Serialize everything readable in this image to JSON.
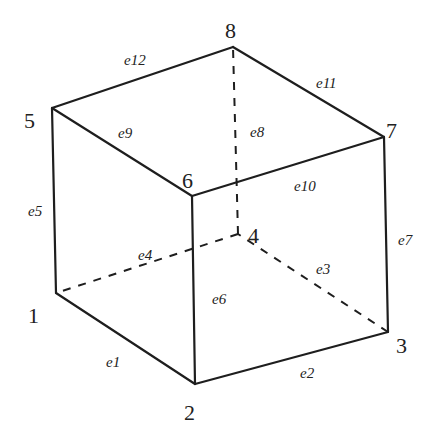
{
  "diagram": {
    "type": "hexahedral-element",
    "nodes": [
      {
        "id": "1",
        "x": 56,
        "y": 293,
        "lx": 28,
        "ly": 323
      },
      {
        "id": "2",
        "x": 195,
        "y": 384,
        "lx": 184,
        "ly": 420
      },
      {
        "id": "3",
        "x": 388,
        "y": 332,
        "lx": 396,
        "ly": 353
      },
      {
        "id": "4",
        "x": 238,
        "y": 234,
        "lx": 248,
        "ly": 243
      },
      {
        "id": "5",
        "x": 52,
        "y": 108,
        "lx": 24,
        "ly": 128
      },
      {
        "id": "6",
        "x": 192,
        "y": 196,
        "lx": 182,
        "ly": 188
      },
      {
        "id": "7",
        "x": 384,
        "y": 137,
        "lx": 386,
        "ly": 138
      },
      {
        "id": "8",
        "x": 233,
        "y": 47,
        "lx": 225,
        "ly": 38
      }
    ],
    "edges": [
      {
        "id": "e1",
        "from": "1",
        "to": "2",
        "hidden": false,
        "lx": 106,
        "ly": 367
      },
      {
        "id": "e2",
        "from": "2",
        "to": "3",
        "hidden": false,
        "lx": 300,
        "ly": 378
      },
      {
        "id": "e3",
        "from": "3",
        "to": "4",
        "hidden": true,
        "lx": 316,
        "ly": 274
      },
      {
        "id": "e4",
        "from": "4",
        "to": "1",
        "hidden": true,
        "lx": 138,
        "ly": 260
      },
      {
        "id": "e5",
        "from": "1",
        "to": "5",
        "hidden": false,
        "lx": 28,
        "ly": 216
      },
      {
        "id": "e6",
        "from": "2",
        "to": "6",
        "hidden": false,
        "lx": 212,
        "ly": 304
      },
      {
        "id": "e7",
        "from": "3",
        "to": "7",
        "hidden": false,
        "lx": 398,
        "ly": 245
      },
      {
        "id": "e8",
        "from": "4",
        "to": "8",
        "hidden": true,
        "lx": 250,
        "ly": 137
      },
      {
        "id": "e9",
        "from": "5",
        "to": "6",
        "hidden": false,
        "lx": 118,
        "ly": 138
      },
      {
        "id": "e10",
        "from": "6",
        "to": "7",
        "hidden": false,
        "lx": 294,
        "ly": 191
      },
      {
        "id": "e11",
        "from": "7",
        "to": "8",
        "hidden": false,
        "lx": 316,
        "ly": 88
      },
      {
        "id": "e12",
        "from": "8",
        "to": "5",
        "hidden": false,
        "lx": 124,
        "ly": 65
      }
    ]
  }
}
